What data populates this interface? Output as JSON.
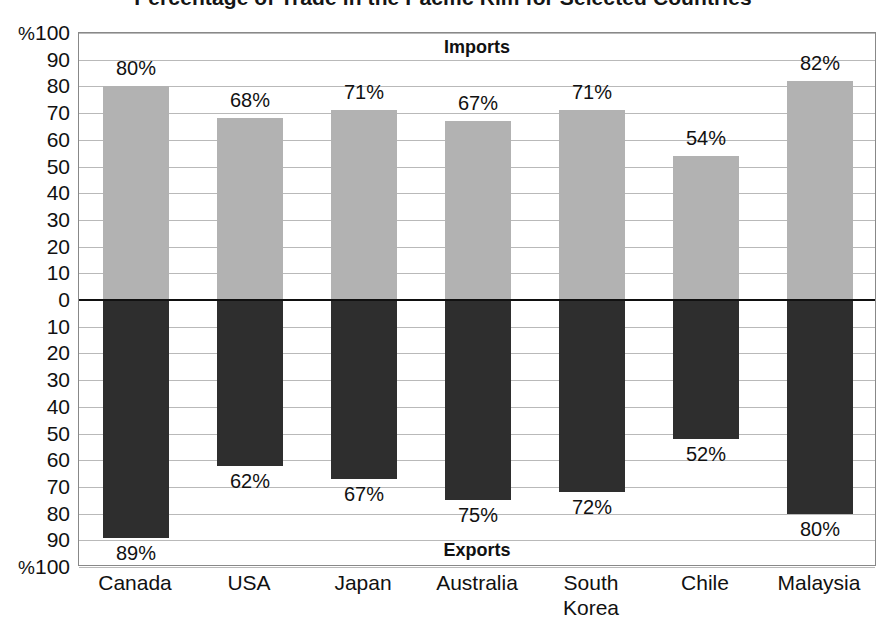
{
  "chart_data": {
    "type": "bar",
    "title": "Percentage of Trade in the Pacific Rim for Selected Countries",
    "xlabel": "",
    "ylabel": "%",
    "orientation": "vertical-diverging",
    "grid": true,
    "legend_position": "inside-top-and-bottom",
    "categories": [
      "Canada",
      "USA",
      "Japan",
      "Australia",
      "South\nKorea",
      "Chile",
      "Malaysia"
    ],
    "series": [
      {
        "name": "Imports",
        "direction": "up",
        "color": "#b2b2b2",
        "values": [
          80,
          68,
          71,
          67,
          71,
          54,
          82
        ],
        "labels": [
          "80%",
          "68%",
          "71%",
          "67%",
          "71%",
          "54%",
          "82%"
        ]
      },
      {
        "name": "Exports",
        "direction": "down",
        "color": "#2e2e2e",
        "values": [
          89,
          62,
          67,
          75,
          72,
          52,
          80
        ],
        "labels": [
          "89%",
          "62%",
          "67%",
          "75%",
          "72%",
          "52%",
          "80%"
        ]
      }
    ],
    "ylim": [
      -100,
      100
    ],
    "y_ticks_upper": [
      "%100",
      "90",
      "80",
      "70",
      "60",
      "50",
      "40",
      "30",
      "20",
      "10",
      "0"
    ],
    "y_ticks_lower": [
      "0",
      "10",
      "20",
      "30",
      "40",
      "50",
      "60",
      "70",
      "80",
      "90",
      "%100"
    ],
    "band_labels": {
      "upper": "Imports",
      "lower": "Exports"
    }
  },
  "axis": {
    "ticks": [
      "%100",
      "90",
      "80",
      "70",
      "60",
      "50",
      "40",
      "30",
      "20",
      "10",
      "0",
      "10",
      "20",
      "30",
      "40",
      "50",
      "60",
      "70",
      "80",
      "90",
      "%100"
    ]
  }
}
